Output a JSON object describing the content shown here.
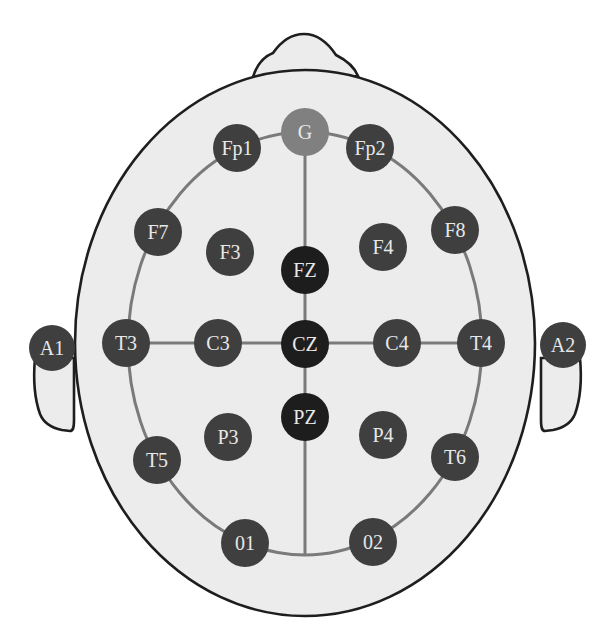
{
  "diagram": {
    "type": "EEG 10-20 electrode placement (top view of head)",
    "colors": {
      "background": "#ffffff",
      "head_fill": "#ececec",
      "outline": "#1e1e1e",
      "guide_lines": "#7a7a7a",
      "electrode_standard": "#3f3f3f",
      "electrode_midline": "#1d1d1d",
      "electrode_ground": "#808080",
      "label_text": "#e8e8e8"
    },
    "electrodes": [
      {
        "label": "G",
        "group": "ground"
      },
      {
        "label": "Fp1",
        "group": "standard"
      },
      {
        "label": "Fp2",
        "group": "standard"
      },
      {
        "label": "F7",
        "group": "standard"
      },
      {
        "label": "F3",
        "group": "standard"
      },
      {
        "label": "FZ",
        "group": "midline"
      },
      {
        "label": "F4",
        "group": "standard"
      },
      {
        "label": "F8",
        "group": "standard"
      },
      {
        "label": "A1",
        "group": "reference"
      },
      {
        "label": "T3",
        "group": "standard"
      },
      {
        "label": "C3",
        "group": "standard"
      },
      {
        "label": "CZ",
        "group": "midline"
      },
      {
        "label": "C4",
        "group": "standard"
      },
      {
        "label": "T4",
        "group": "standard"
      },
      {
        "label": "A2",
        "group": "reference"
      },
      {
        "label": "T5",
        "group": "standard"
      },
      {
        "label": "P3",
        "group": "standard"
      },
      {
        "label": "PZ",
        "group": "midline"
      },
      {
        "label": "P4",
        "group": "standard"
      },
      {
        "label": "T6",
        "group": "standard"
      },
      {
        "label": "01",
        "group": "standard"
      },
      {
        "label": "02",
        "group": "standard"
      }
    ]
  }
}
